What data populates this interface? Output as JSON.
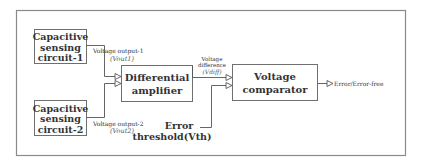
{
  "colors": {
    "frame": "#8a8a8a",
    "box_border": "#6f6f6f",
    "line": "#555555",
    "text": "#333333"
  },
  "blocks": {
    "sensor1": {
      "line1": "Capacitive",
      "line2": "sensing",
      "line3": "circuit-1"
    },
    "sensor2": {
      "line1": "Capacitive",
      "line2": "sensing",
      "line3": "circuit-2"
    },
    "diff_amp": {
      "line1": "Differential",
      "line2": "amplifier"
    },
    "comparator": {
      "line1": "Voltage",
      "line2": "comparator"
    }
  },
  "signals": {
    "vout1": {
      "label": "Voltage output-1",
      "symbol": "(Vout1)"
    },
    "vout2": {
      "label": "Voltage output-2",
      "symbol": "(Vout2)"
    },
    "vdiff": {
      "label_line1": "Voltage",
      "label_line2": "difference",
      "symbol": "(Vdiff)"
    },
    "threshold": {
      "label_line1": "Error",
      "label_line2": "threshold(Vth)"
    },
    "output": {
      "label": "Error/Error-free"
    }
  }
}
